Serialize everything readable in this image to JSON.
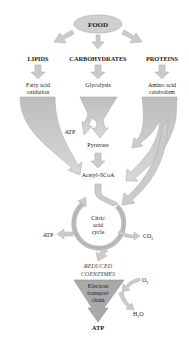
{
  "diagram": {
    "source_node": "FOOD",
    "categories": [
      {
        "label": "LIPIDS",
        "process": [
          "Fatty acid",
          "oxidation"
        ]
      },
      {
        "label": "CARBOHYDRATES",
        "process": [
          "Glycolysis"
        ]
      },
      {
        "label": "PROTEINS",
        "process": [
          "Amino acid",
          "catabolism"
        ]
      }
    ],
    "glycolysis_atp": "ATP",
    "pyruvate": "Pyruvate",
    "acetyl": "Acetyl-SCoA",
    "cycle": [
      "Citric",
      "acid",
      "cycle"
    ],
    "cycle_atp": "ATP",
    "co2": "CO",
    "co2_sub": "2",
    "reduced": [
      "REDUCED",
      "COENZYMES"
    ],
    "etc": [
      "Electron",
      "transport",
      "chain"
    ],
    "o2": "O",
    "o2_sub": "2",
    "h2o_h": "H",
    "h2o_sub": "2",
    "h2o_o": "O",
    "final_atp": "ATP"
  },
  "colors": {
    "arrow_fill": "#c8c8c8",
    "arrow_stroke": "#b0b0b0",
    "node_fill": "#cfcfcf",
    "etc_fill": "#a8a8a8"
  }
}
